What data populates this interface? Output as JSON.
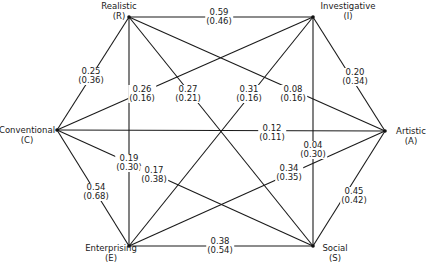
{
  "nodes": {
    "R": {
      "name": "Realistic",
      "code": "(R)",
      "x": 129,
      "y": 17
    },
    "I": {
      "name": "Investigative",
      "code": "(I)",
      "x": 313,
      "y": 17
    },
    "A": {
      "name": "Artistic",
      "code": "(A)",
      "x": 385,
      "y": 131
    },
    "S": {
      "name": "Social",
      "code": "(S)",
      "x": 313,
      "y": 246
    },
    "E": {
      "name": "Enterprising",
      "code": "(E)",
      "x": 129,
      "y": 246
    },
    "C": {
      "name": "Conventional",
      "code": "(C)",
      "x": 57,
      "y": 130
    }
  },
  "edges": [
    {
      "id": "R-I",
      "from": "R",
      "to": "I",
      "value": "0.59",
      "paren": "(0.46)"
    },
    {
      "id": "I-A",
      "from": "I",
      "to": "A",
      "value": "0.20",
      "paren": "(0.34)"
    },
    {
      "id": "A-S",
      "from": "A",
      "to": "S",
      "value": "0.45",
      "paren": "(0.42)"
    },
    {
      "id": "S-E",
      "from": "S",
      "to": "E",
      "value": "0.38",
      "paren": "(0.54)"
    },
    {
      "id": "E-C",
      "from": "E",
      "to": "C",
      "value": "0.54",
      "paren": "(0.68)"
    },
    {
      "id": "C-R",
      "from": "C",
      "to": "R",
      "value": "0.25",
      "paren": "(0.36)"
    },
    {
      "id": "C-I",
      "from": "C",
      "to": "I",
      "value": "0.26",
      "paren": "(0.16)"
    },
    {
      "id": "R-S",
      "from": "R",
      "to": "S",
      "value": "0.27",
      "paren": "(0.21)"
    },
    {
      "id": "I-E",
      "from": "I",
      "to": "E",
      "value": "0.31",
      "paren": "(0.16)"
    },
    {
      "id": "R-A",
      "from": "R",
      "to": "A",
      "value": "0.08",
      "paren": "(0.16)"
    },
    {
      "id": "C-A",
      "from": "C",
      "to": "A",
      "value": "0.12",
      "paren": "(0.11)"
    },
    {
      "id": "R-E",
      "from": "R",
      "to": "E",
      "value": "0.19",
      "paren": "(0.30)"
    },
    {
      "id": "I-S",
      "from": "I",
      "to": "S",
      "value": "0.04",
      "paren": "(0.30)"
    },
    {
      "id": "C-S",
      "from": "C",
      "to": "S",
      "value": "0.17",
      "paren": "(0.38)"
    },
    {
      "id": "A-E",
      "from": "A",
      "to": "E",
      "value": "0.34",
      "paren": "(0.35)"
    }
  ],
  "labels": {
    "R-I": {
      "x": 219,
      "y": 17
    },
    "I-A": {
      "x": 355,
      "y": 77
    },
    "A-S": {
      "x": 354,
      "y": 196
    },
    "S-E": {
      "x": 220,
      "y": 246
    },
    "E-C": {
      "x": 96,
      "y": 192
    },
    "C-R": {
      "x": 91,
      "y": 76
    },
    "C-I": {
      "x": 142,
      "y": 94
    },
    "R-S": {
      "x": 188,
      "y": 94
    },
    "I-E": {
      "x": 249,
      "y": 94
    },
    "R-A": {
      "x": 293,
      "y": 94
    },
    "C-A": {
      "x": 272,
      "y": 133
    },
    "R-E": {
      "x": 129,
      "y": 163
    },
    "I-S": {
      "x": 313,
      "y": 150
    },
    "C-S": {
      "x": 154,
      "y": 175
    },
    "A-E": {
      "x": 289,
      "y": 173
    }
  }
}
